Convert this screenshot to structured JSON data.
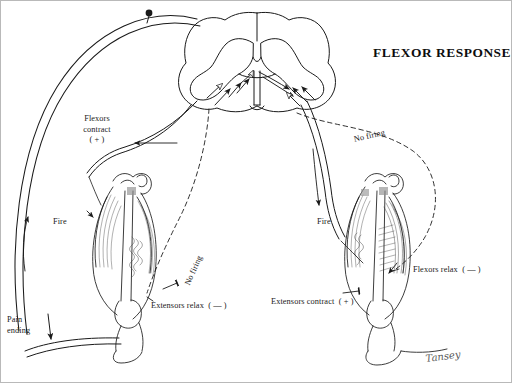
{
  "figure": {
    "title": "FLEXOR RESPONSE",
    "signature": "Tansey",
    "background_color": "#ffffff",
    "ink_color": "#1a1a1a",
    "border_color": "#b9b9b9"
  },
  "labels": {
    "flexors_contract": "Flexors\ncontract\n( + )",
    "flexors_relax": "Flexors relax  ( — )",
    "extensors_relax": "Extensors relax  ( — )",
    "extensors_contract": "Extensors contract  ( + )",
    "fire_left": "Fire",
    "fire_right": "Fire",
    "no_firing_right": "No firing",
    "no_firing_left": "No firing",
    "pain_ending": "Pain\nending"
  },
  "anatomy": {
    "spinal_cord": "spinal-cord-cross-section",
    "gray_matter": "butterfly-gray-matter",
    "central_canal": "central-canal",
    "left_limb": "left-hindlimb-flexed",
    "right_limb": "right-hindlimb-extended",
    "cell_body": "afferent-neuron-cell-body"
  },
  "pathways": [
    {
      "name": "afferent-pain-pathway",
      "style": "solid",
      "direction": "upward-ipsilateral"
    },
    {
      "name": "ipsilateral-flexor-efferent",
      "style": "solid",
      "direction": "to-left-limb"
    },
    {
      "name": "ipsilateral-extensor-inhibition",
      "style": "dashed",
      "direction": "to-left-limb"
    },
    {
      "name": "crossed-extensor-efferent",
      "style": "solid",
      "direction": "to-right-limb"
    },
    {
      "name": "crossed-flexor-inhibition",
      "style": "dashed",
      "direction": "to-right-limb"
    }
  ]
}
